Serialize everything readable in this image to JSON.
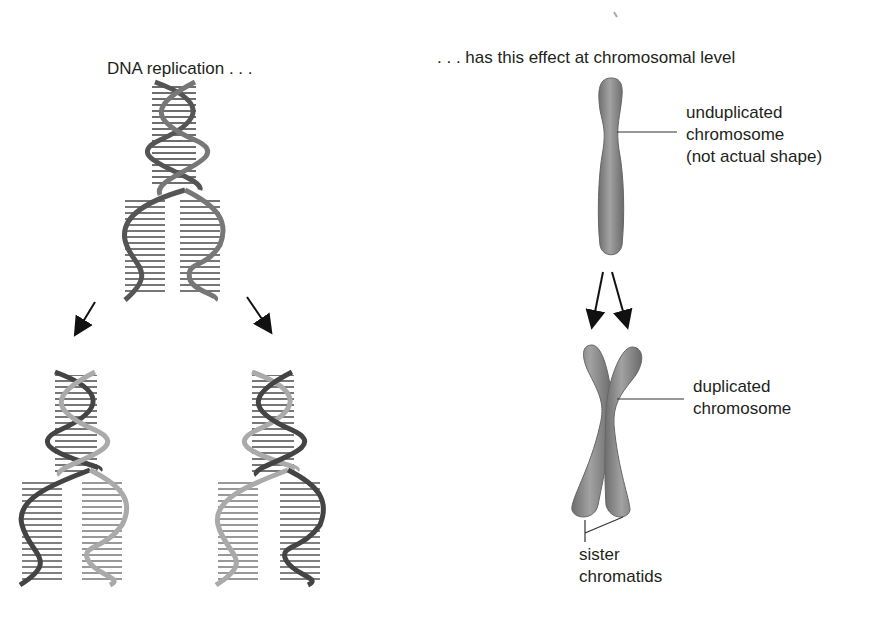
{
  "left_panel": {
    "title": "DNA replication . . .",
    "parent_helix": "parent DNA double helix (unwinding)",
    "daughter_helices": [
      "daughter DNA helix 1",
      "daughter DNA helix 2"
    ]
  },
  "right_panel": {
    "title": ". . . has this effect at chromosomal level",
    "unduplicated_label": [
      "unduplicated",
      "chromosome",
      "(not actual shape)"
    ],
    "duplicated_label": [
      "duplicated",
      "chromosome"
    ],
    "sister_label": [
      "sister",
      "chromatids"
    ]
  },
  "colors": {
    "text": "#231f20",
    "strand_dark": "#4a4a4a",
    "strand_light": "#a8a8a8",
    "chromosome": "#8c8c8c",
    "arrow": "#111111"
  }
}
